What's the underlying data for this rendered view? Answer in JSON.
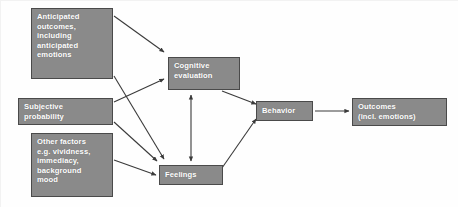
{
  "diagram": {
    "background_color": "#fefefe",
    "node_fill_color": "#8a8a8a",
    "node_border_color": "#4a4a4a",
    "node_text_color": "#ffffff",
    "arrow_color": "#3a3a3a",
    "nodes": [
      {
        "id": "anticipated",
        "lines": [
          "Anticipated",
          "outcomes,",
          "including",
          "anticipated",
          "emotions"
        ]
      },
      {
        "id": "subjective",
        "lines": [
          "Subjective",
          "probability"
        ]
      },
      {
        "id": "other",
        "lines": [
          "Other factors",
          "e.g. vividness,",
          "immediacy,",
          "background",
          "mood"
        ]
      },
      {
        "id": "cognitive",
        "lines": [
          "Cognitive",
          "evaluation"
        ]
      },
      {
        "id": "feelings",
        "lines": [
          "Feelings"
        ]
      },
      {
        "id": "behavior",
        "lines": [
          "Behavior"
        ]
      },
      {
        "id": "outcomes",
        "lines": [
          "Outcomes",
          "(incl. emotions)"
        ]
      }
    ],
    "edges": [
      {
        "id": "anticipated-to-cognitive",
        "from": "anticipated",
        "to": "cognitive",
        "heads": 1
      },
      {
        "id": "anticipated-to-feelings",
        "from": "anticipated",
        "to": "feelings",
        "heads": 1
      },
      {
        "id": "subjective-to-cognitive",
        "from": "subjective",
        "to": "cognitive",
        "heads": 1
      },
      {
        "id": "subjective-to-feelings",
        "from": "subjective",
        "to": "feelings",
        "heads": 1
      },
      {
        "id": "other-to-feelings",
        "from": "other",
        "to": "feelings",
        "heads": 1
      },
      {
        "id": "cognitive-feelings-bidirectional",
        "from": "cognitive",
        "to": "feelings",
        "heads": 2
      },
      {
        "id": "cognitive-to-behavior",
        "from": "cognitive",
        "to": "behavior",
        "heads": 1
      },
      {
        "id": "feelings-to-behavior",
        "from": "feelings",
        "to": "behavior",
        "heads": 1
      },
      {
        "id": "behavior-to-outcomes",
        "from": "behavior",
        "to": "outcomes",
        "heads": 1
      }
    ]
  }
}
